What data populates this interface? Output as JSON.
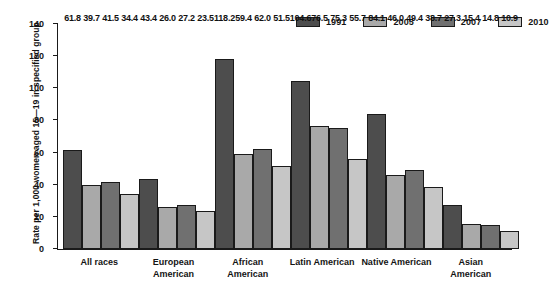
{
  "chart_data": {
    "type": "bar",
    "title": "",
    "subtitle": "",
    "xlabel": "",
    "ylabel": "Rate per 1,000 women aged 15—19 in specified group",
    "ylim": [
      0,
      140
    ],
    "ytick_step": 20,
    "yticks": [
      "0",
      "20",
      "40",
      "60",
      "80",
      "100",
      "120",
      "140"
    ],
    "grid": false,
    "legend_position": "top-right",
    "categories": [
      "All races",
      "European\nAmerican",
      "African\nAmerican",
      "Latin American",
      "Native American",
      "Asian\nAmerican"
    ],
    "series": [
      {
        "name": "1991",
        "color": "#4d4d4d",
        "values": [
          61.8,
          43.4,
          118.2,
          104.6,
          84.1,
          27.3
        ],
        "labels": [
          "61.8",
          "43.4",
          "118.2",
          "104.6",
          "84.1",
          "27.3"
        ]
      },
      {
        "name": "2005",
        "color": "#a9a9a9",
        "values": [
          39.7,
          26.0,
          59.4,
          76.5,
          46.0,
          15.4
        ],
        "labels": [
          "39.7",
          "26.0",
          "59.4",
          "76.5",
          "46.0",
          "15.4"
        ]
      },
      {
        "name": "2007",
        "color": "#707070",
        "values": [
          41.5,
          27.2,
          62.0,
          75.3,
          49.4,
          14.8
        ],
        "labels": [
          "41.5",
          "27.2",
          "62.0",
          "75.3",
          "49.4",
          "14.8"
        ]
      },
      {
        "name": "2010",
        "color": "#c6c6c6",
        "values": [
          34.4,
          23.5,
          51.5,
          55.7,
          38.7,
          10.9
        ],
        "labels": [
          "34.4",
          "23.5",
          "51.5",
          "55.7",
          "38.7",
          "10.9"
        ]
      }
    ]
  },
  "legend": {
    "entries": [
      {
        "label": "1991",
        "color": "#4d4d4d"
      },
      {
        "label": "2005",
        "color": "#a9a9a9"
      },
      {
        "label": "2007",
        "color": "#707070"
      },
      {
        "label": "2010",
        "color": "#c6c6c6"
      }
    ]
  },
  "axis": {
    "y_title": "Rate per 1,000 women aged 15—19 in specified group"
  }
}
